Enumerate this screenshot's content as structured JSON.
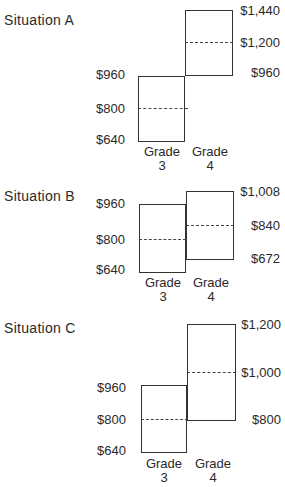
{
  "situations": [
    {
      "title": "Situation A",
      "grade3": {
        "label": "Grade",
        "num": "3",
        "top": "$960",
        "mid": "$800",
        "bottom": "$640"
      },
      "grade4": {
        "label": "Grade",
        "num": "4",
        "top": "$1,440",
        "mid": "$1,200",
        "bottom": "$960"
      }
    },
    {
      "title": "Situation B",
      "grade3": {
        "label": "Grade",
        "num": "3",
        "top": "$960",
        "mid": "$800",
        "bottom": "$640"
      },
      "grade4": {
        "label": "Grade",
        "num": "4",
        "top": "$1,008",
        "mid": "$840",
        "bottom": "$672"
      }
    },
    {
      "title": "Situation C",
      "grade3": {
        "label": "Grade",
        "num": "3",
        "top": "$960",
        "mid": "$800",
        "bottom": "$640"
      },
      "grade4": {
        "label": "Grade",
        "num": "4",
        "top": "$1,200",
        "mid": "$1,000",
        "bottom": "$800"
      }
    }
  ]
}
